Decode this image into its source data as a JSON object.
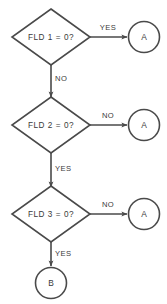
{
  "diagram": {
    "background_color": "#ffffff",
    "line_color": "#4a4a4a",
    "text_color": "#3a3a3a",
    "decisions": [
      {
        "id": "d1",
        "label": "FLD 1 = 0?",
        "yes_label": "YES",
        "no_label": "NO"
      },
      {
        "id": "d2",
        "label": "FLD 2 = 0?",
        "yes_label": "YES",
        "no_label": "NO"
      },
      {
        "id": "d3",
        "label": "FLD 3 = 0?",
        "yes_label": "YES",
        "no_label": "NO"
      }
    ],
    "connectors": [
      {
        "id": "c1",
        "label": "A"
      },
      {
        "id": "c2",
        "label": "A"
      },
      {
        "id": "c3",
        "label": "A"
      },
      {
        "id": "c4",
        "label": "B"
      }
    ],
    "edges": [
      {
        "from": "d1",
        "to": "c1",
        "label": "YES",
        "direction": "right"
      },
      {
        "from": "d1",
        "to": "d2",
        "label": "NO",
        "direction": "down"
      },
      {
        "from": "d2",
        "to": "c2",
        "label": "NO",
        "direction": "right"
      },
      {
        "from": "d2",
        "to": "d3",
        "label": "YES",
        "direction": "down"
      },
      {
        "from": "d3",
        "to": "c3",
        "label": "NO",
        "direction": "right"
      },
      {
        "from": "d3",
        "to": "c4",
        "label": "YES",
        "direction": "down"
      }
    ]
  }
}
